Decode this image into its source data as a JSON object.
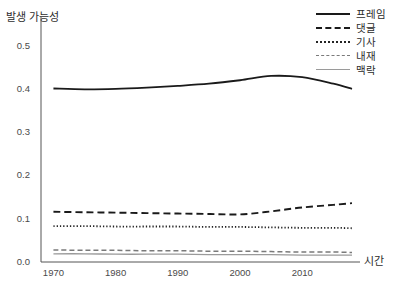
{
  "chart_data": {
    "type": "line",
    "title": "",
    "xlabel": "시간",
    "ylabel": "발생 가능성",
    "xlim": [
      1968,
      2018
    ],
    "ylim": [
      0.0,
      0.55
    ],
    "grid": false,
    "legend_position": "top-right",
    "y_ticks": [
      "0.5",
      "0.4",
      "0.3",
      "0.2",
      "0.1",
      "0.0"
    ],
    "y_tick_values": [
      0.5,
      0.4,
      0.3,
      0.2,
      0.1,
      0.0
    ],
    "x_ticks": [
      "1970",
      "1980",
      "1990",
      "2000",
      "2010"
    ],
    "x_tick_values": [
      1970,
      1980,
      1990,
      2000,
      2010
    ],
    "x": [
      1970,
      1975,
      1980,
      1985,
      1990,
      1995,
      2000,
      2005,
      2010,
      2015,
      2018
    ],
    "series": [
      {
        "name": "프레임",
        "style": "solid",
        "color": "#1a1a1a",
        "values": [
          0.401,
          0.399,
          0.4,
          0.403,
          0.407,
          0.412,
          0.42,
          0.43,
          0.427,
          0.412,
          0.4
        ]
      },
      {
        "name": "댓글",
        "style": "dash-dot",
        "color": "#1a1a1a",
        "values": [
          0.116,
          0.115,
          0.114,
          0.113,
          0.112,
          0.111,
          0.11,
          0.117,
          0.126,
          0.132,
          0.136
        ]
      },
      {
        "name": "기사",
        "style": "dotted",
        "color": "#242424",
        "values": [
          0.083,
          0.083,
          0.082,
          0.082,
          0.082,
          0.081,
          0.081,
          0.08,
          0.079,
          0.079,
          0.078
        ]
      },
      {
        "name": "내재",
        "style": "dashed",
        "color": "#7a7a7a",
        "values": [
          0.028,
          0.027,
          0.027,
          0.026,
          0.026,
          0.025,
          0.025,
          0.024,
          0.023,
          0.023,
          0.022
        ]
      },
      {
        "name": "맥락",
        "style": "thin-solid",
        "color": "#9a9a9a",
        "values": [
          0.019,
          0.019,
          0.018,
          0.018,
          0.018,
          0.017,
          0.017,
          0.017,
          0.016,
          0.016,
          0.016
        ]
      }
    ]
  },
  "legend": {
    "items": [
      {
        "label": "프레임"
      },
      {
        "label": "댓글"
      },
      {
        "label": "기사"
      },
      {
        "label": "내재"
      },
      {
        "label": "맥락"
      }
    ]
  }
}
